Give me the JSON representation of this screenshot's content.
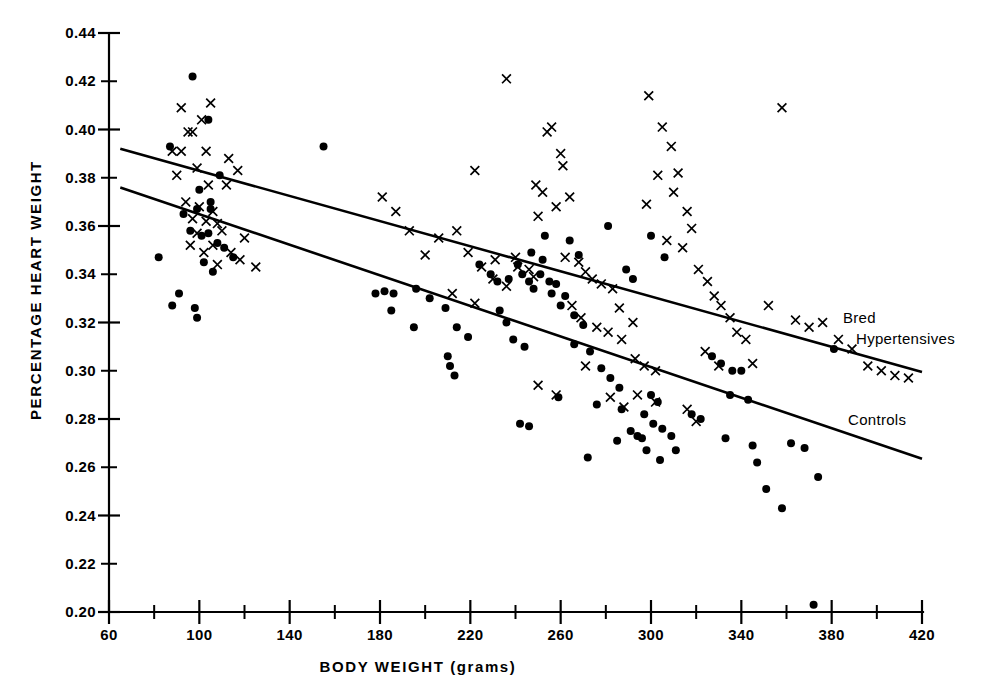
{
  "chart_data": {
    "type": "scatter",
    "title": "",
    "xlabel": "BODY WEIGHT (grams)",
    "ylabel": "PERCENTAGE HEART WEIGHT",
    "xlim": [
      60,
      420
    ],
    "ylim": [
      0.2,
      0.44
    ],
    "x_tick_labels": [
      "60",
      "100",
      "140",
      "180",
      "220",
      "260",
      "300",
      "340",
      "380",
      "420"
    ],
    "x_tick_values": [
      60,
      100,
      140,
      180,
      220,
      260,
      300,
      340,
      380,
      420
    ],
    "x_minor_tick_values": [
      80,
      120,
      160,
      200,
      240,
      280,
      320,
      360,
      400
    ],
    "y_tick_labels": [
      "0.20",
      "0.22",
      "0.24",
      "0.26",
      "0.28",
      "0.30",
      "0.32",
      "0.34",
      "0.36",
      "0.38",
      "0.40",
      "0.42",
      "0.44"
    ],
    "y_tick_values": [
      0.2,
      0.22,
      0.24,
      0.26,
      0.28,
      0.3,
      0.32,
      0.34,
      0.36,
      0.38,
      0.4,
      0.42,
      0.44
    ],
    "grid": false,
    "legend_position": "inline-right-of-lines",
    "series": [
      {
        "name": "Bred Hypertensives",
        "marker": "cross",
        "label": "Bred",
        "label_line2": "Hypertensives",
        "label_full": "Bred Hypertensives",
        "fit_line": {
          "x_start": 65,
          "y_start": 0.392,
          "x_end": 420,
          "y_end": 0.2995
        },
        "points": [
          [
            92,
            0.409
          ],
          [
            95,
            0.399
          ],
          [
            97,
            0.399
          ],
          [
            105,
            0.411
          ],
          [
            101,
            0.404
          ],
          [
            88,
            0.391
          ],
          [
            92,
            0.391
          ],
          [
            103,
            0.391
          ],
          [
            99,
            0.384
          ],
          [
            113,
            0.388
          ],
          [
            90,
            0.381
          ],
          [
            117,
            0.383
          ],
          [
            104,
            0.377
          ],
          [
            112,
            0.377
          ],
          [
            94,
            0.37
          ],
          [
            100,
            0.368
          ],
          [
            106,
            0.366
          ],
          [
            97,
            0.363
          ],
          [
            103,
            0.362
          ],
          [
            108,
            0.361
          ],
          [
            99,
            0.357
          ],
          [
            110,
            0.358
          ],
          [
            106,
            0.352
          ],
          [
            120,
            0.355
          ],
          [
            114,
            0.349
          ],
          [
            96,
            0.352
          ],
          [
            102,
            0.349
          ],
          [
            118,
            0.346
          ],
          [
            108,
            0.344
          ],
          [
            125,
            0.343
          ],
          [
            181,
            0.372
          ],
          [
            187,
            0.366
          ],
          [
            193,
            0.358
          ],
          [
            206,
            0.355
          ],
          [
            200,
            0.348
          ],
          [
            214,
            0.358
          ],
          [
            219,
            0.349
          ],
          [
            225,
            0.343
          ],
          [
            231,
            0.346
          ],
          [
            230,
            0.338
          ],
          [
            212,
            0.332
          ],
          [
            222,
            0.328
          ],
          [
            236,
            0.335
          ],
          [
            240,
            0.347
          ],
          [
            241,
            0.343
          ],
          [
            246,
            0.342
          ],
          [
            248,
            0.339
          ],
          [
            222,
            0.383
          ],
          [
            236,
            0.421
          ],
          [
            249,
            0.377
          ],
          [
            260,
            0.39
          ],
          [
            261,
            0.385
          ],
          [
            256,
            0.401
          ],
          [
            254,
            0.399
          ],
          [
            252,
            0.374
          ],
          [
            258,
            0.368
          ],
          [
            264,
            0.372
          ],
          [
            250,
            0.364
          ],
          [
            262,
            0.347
          ],
          [
            268,
            0.345
          ],
          [
            271,
            0.341
          ],
          [
            274,
            0.338
          ],
          [
            278,
            0.336
          ],
          [
            283,
            0.334
          ],
          [
            265,
            0.327
          ],
          [
            269,
            0.322
          ],
          [
            276,
            0.318
          ],
          [
            281,
            0.316
          ],
          [
            287,
            0.313
          ],
          [
            292,
            0.32
          ],
          [
            286,
            0.326
          ],
          [
            293,
            0.305
          ],
          [
            297,
            0.302
          ],
          [
            302,
            0.3
          ],
          [
            299,
            0.414
          ],
          [
            305,
            0.401
          ],
          [
            309,
            0.393
          ],
          [
            312,
            0.382
          ],
          [
            303,
            0.381
          ],
          [
            310,
            0.374
          ],
          [
            298,
            0.369
          ],
          [
            316,
            0.366
          ],
          [
            318,
            0.359
          ],
          [
            307,
            0.354
          ],
          [
            314,
            0.351
          ],
          [
            321,
            0.342
          ],
          [
            325,
            0.337
          ],
          [
            328,
            0.331
          ],
          [
            331,
            0.327
          ],
          [
            335,
            0.322
          ],
          [
            338,
            0.316
          ],
          [
            342,
            0.313
          ],
          [
            324,
            0.308
          ],
          [
            330,
            0.302
          ],
          [
            345,
            0.303
          ],
          [
            352,
            0.327
          ],
          [
            358,
            0.409
          ],
          [
            364,
            0.321
          ],
          [
            370,
            0.318
          ],
          [
            376,
            0.32
          ],
          [
            383,
            0.313
          ],
          [
            389,
            0.309
          ],
          [
            396,
            0.302
          ],
          [
            402,
            0.3
          ],
          [
            408,
            0.298
          ],
          [
            414,
            0.297
          ],
          [
            294,
            0.29
          ],
          [
            302,
            0.287
          ],
          [
            288,
            0.285
          ],
          [
            282,
            0.289
          ],
          [
            258,
            0.29
          ],
          [
            250,
            0.294
          ],
          [
            271,
            0.302
          ],
          [
            316,
            0.284
          ],
          [
            320,
            0.279
          ]
        ]
      },
      {
        "name": "Controls",
        "marker": "dot",
        "label": "Controls",
        "label_full": "Controls",
        "fit_line": {
          "x_start": 65,
          "y_start": 0.376,
          "x_end": 420,
          "y_end": 0.2635
        },
        "points": [
          [
            97,
            0.422
          ],
          [
            104,
            0.404
          ],
          [
            87,
            0.393
          ],
          [
            109,
            0.381
          ],
          [
            100,
            0.375
          ],
          [
            93,
            0.365
          ],
          [
            99,
            0.367
          ],
          [
            105,
            0.367
          ],
          [
            105,
            0.37
          ],
          [
            96,
            0.358
          ],
          [
            104,
            0.357
          ],
          [
            101,
            0.356
          ],
          [
            108,
            0.353
          ],
          [
            111,
            0.351
          ],
          [
            115,
            0.347
          ],
          [
            82,
            0.347
          ],
          [
            91,
            0.332
          ],
          [
            102,
            0.345
          ],
          [
            106,
            0.341
          ],
          [
            88,
            0.327
          ],
          [
            98,
            0.326
          ],
          [
            99,
            0.322
          ],
          [
            155,
            0.393
          ],
          [
            178,
            0.332
          ],
          [
            182,
            0.333
          ],
          [
            186,
            0.332
          ],
          [
            185,
            0.325
          ],
          [
            196,
            0.334
          ],
          [
            202,
            0.33
          ],
          [
            195,
            0.318
          ],
          [
            209,
            0.326
          ],
          [
            214,
            0.318
          ],
          [
            219,
            0.314
          ],
          [
            210,
            0.306
          ],
          [
            211,
            0.302
          ],
          [
            213,
            0.298
          ],
          [
            224,
            0.344
          ],
          [
            229,
            0.34
          ],
          [
            232,
            0.337
          ],
          [
            237,
            0.338
          ],
          [
            241,
            0.344
          ],
          [
            243,
            0.34
          ],
          [
            246,
            0.337
          ],
          [
            248,
            0.334
          ],
          [
            247,
            0.349
          ],
          [
            252,
            0.346
          ],
          [
            251,
            0.34
          ],
          [
            255,
            0.337
          ],
          [
            258,
            0.336
          ],
          [
            256,
            0.332
          ],
          [
            262,
            0.331
          ],
          [
            260,
            0.327
          ],
          [
            266,
            0.323
          ],
          [
            270,
            0.319
          ],
          [
            233,
            0.325
          ],
          [
            236,
            0.32
          ],
          [
            239,
            0.313
          ],
          [
            244,
            0.31
          ],
          [
            242,
            0.278
          ],
          [
            246,
            0.277
          ],
          [
            259,
            0.289
          ],
          [
            266,
            0.311
          ],
          [
            273,
            0.308
          ],
          [
            278,
            0.301
          ],
          [
            282,
            0.297
          ],
          [
            286,
            0.293
          ],
          [
            276,
            0.286
          ],
          [
            287,
            0.284
          ],
          [
            272,
            0.264
          ],
          [
            285,
            0.271
          ],
          [
            291,
            0.275
          ],
          [
            294,
            0.273
          ],
          [
            296,
            0.272
          ],
          [
            300,
            0.29
          ],
          [
            303,
            0.287
          ],
          [
            297,
            0.282
          ],
          [
            301,
            0.278
          ],
          [
            305,
            0.276
          ],
          [
            309,
            0.273
          ],
          [
            298,
            0.267
          ],
          [
            304,
            0.263
          ],
          [
            311,
            0.267
          ],
          [
            318,
            0.282
          ],
          [
            322,
            0.28
          ],
          [
            327,
            0.306
          ],
          [
            331,
            0.303
          ],
          [
            336,
            0.3
          ],
          [
            340,
            0.3
          ],
          [
            335,
            0.29
          ],
          [
            343,
            0.288
          ],
          [
            333,
            0.272
          ],
          [
            345,
            0.269
          ],
          [
            351,
            0.251
          ],
          [
            358,
            0.243
          ],
          [
            347,
            0.262
          ],
          [
            362,
            0.27
          ],
          [
            368,
            0.268
          ],
          [
            374,
            0.256
          ],
          [
            381,
            0.309
          ],
          [
            372,
            0.203
          ],
          [
            289,
            0.342
          ],
          [
            292,
            0.338
          ],
          [
            300,
            0.356
          ],
          [
            306,
            0.347
          ],
          [
            281,
            0.36
          ],
          [
            268,
            0.348
          ],
          [
            253,
            0.356
          ],
          [
            264,
            0.354
          ]
        ]
      }
    ]
  },
  "axes": {
    "y_axis_title": "PERCENTAGE HEART WEIGHT",
    "x_axis_title": "BODY WEIGHT (grams)"
  }
}
